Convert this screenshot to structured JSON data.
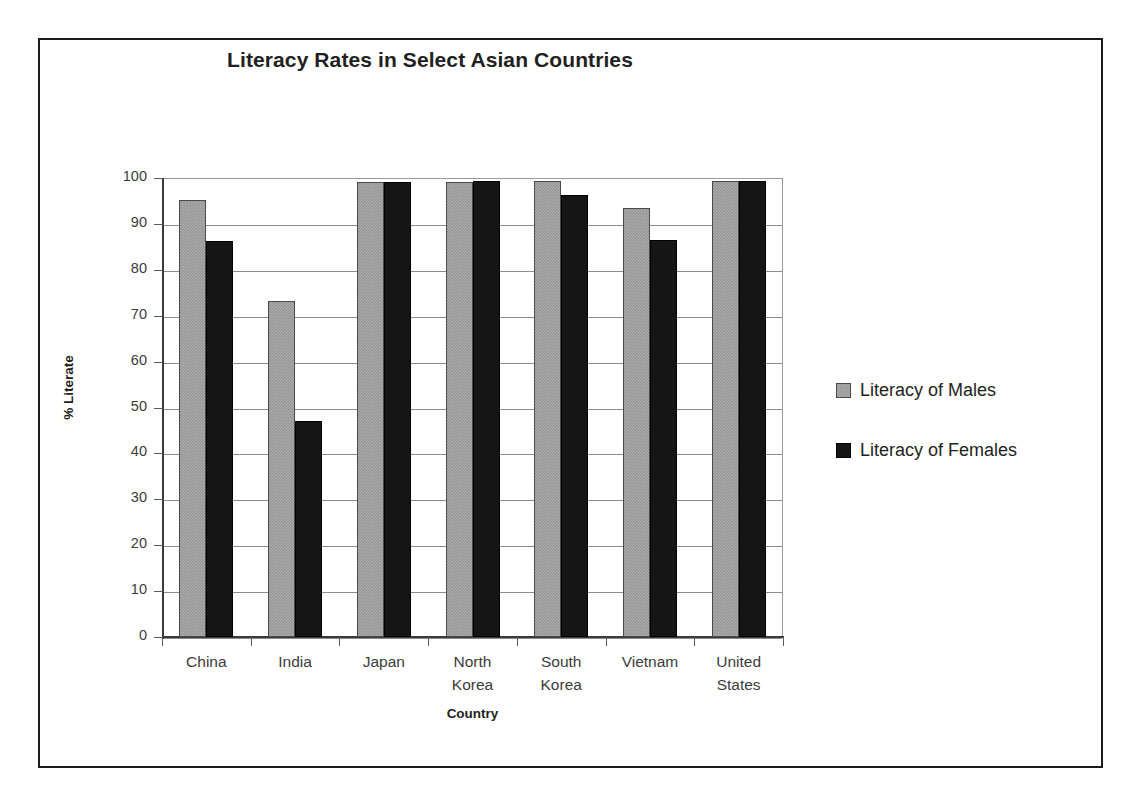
{
  "chart_data": {
    "type": "bar",
    "title": "Literacy Rates in Select Asian Countries",
    "xlabel": "Country",
    "ylabel": "% Literate",
    "categories": [
      "China",
      "India",
      "Japan",
      "North Korea",
      "South Korea",
      "Vietnam",
      "United States"
    ],
    "category_lines": [
      [
        "China"
      ],
      [
        "India"
      ],
      [
        "Japan"
      ],
      [
        "North",
        "Korea"
      ],
      [
        "South",
        "Korea"
      ],
      [
        "Vietnam"
      ],
      [
        "United",
        "States"
      ]
    ],
    "series": [
      {
        "name": "Literacy of Males",
        "color": "#969696",
        "values": [
          95.1,
          73.2,
          99.2,
          99.2,
          99.4,
          93.5,
          99.3
        ]
      },
      {
        "name": "Literacy of Females",
        "color": "#151515",
        "values": [
          86.2,
          47.1,
          99.2,
          99.4,
          96.3,
          86.6,
          99.3
        ]
      }
    ],
    "ylim": [
      0,
      100
    ],
    "ytick_step": 10,
    "yticks": [
      100,
      90,
      80,
      70,
      60,
      50,
      40,
      30,
      20,
      10,
      0
    ],
    "grid": true,
    "legend_position": "right"
  },
  "legend": {
    "entries": [
      {
        "label": "Literacy of Males",
        "swatch": "gray-pattern-swatch"
      },
      {
        "label": "Literacy of Females",
        "swatch": "black-swatch"
      }
    ]
  }
}
